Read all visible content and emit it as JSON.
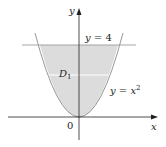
{
  "diagram": {
    "type": "region-plot",
    "colors": {
      "region_fill": "#dcdcdc",
      "axis": "#231f20",
      "line_y4": "#9a9a9a",
      "curve": "#8a8a8a",
      "divider": "#ffffff"
    },
    "axes": {
      "x_label": "x",
      "y_label": "y",
      "origin_label": "0"
    },
    "curves": [
      {
        "name": "horizontal-line",
        "equation_lhs": "y = 4",
        "label": "y = 4"
      },
      {
        "name": "parabola",
        "equation_lhs": "y = x",
        "exponent": "2",
        "label": "y = x²"
      }
    ],
    "region": {
      "label_main": "D",
      "label_sub": "1",
      "description": "Region between y = x² and y = 4"
    }
  }
}
